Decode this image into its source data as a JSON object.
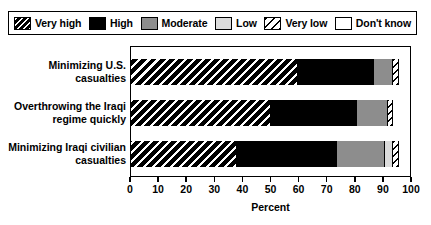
{
  "legend": {
    "items": [
      {
        "label": "Very high",
        "key": "veryhigh",
        "swatch": "black-diagonal-stripe-swatch",
        "color": "#000000"
      },
      {
        "label": "High",
        "key": "high",
        "swatch": "solid-black-swatch",
        "color": "#000000"
      },
      {
        "label": "Moderate",
        "key": "moderate",
        "swatch": "solid-gray-swatch",
        "color": "#8d8d8d"
      },
      {
        "label": "Low",
        "key": "low",
        "swatch": "solid-light-gray-swatch",
        "color": "#dcdcdc"
      },
      {
        "label": "Very low",
        "key": "verylow",
        "swatch": "white-diagonal-stripe-swatch",
        "color": "#ffffff"
      },
      {
        "label": "Don't know",
        "key": "dontknow",
        "swatch": "solid-white-swatch",
        "color": "#ffffff"
      }
    ]
  },
  "chart_data": {
    "type": "bar",
    "orientation": "horizontal",
    "stacked": true,
    "title": "",
    "xlabel": "Percent",
    "ylabel": "",
    "xlim": [
      0,
      100
    ],
    "xticks": [
      0,
      10,
      20,
      30,
      40,
      50,
      60,
      70,
      80,
      90,
      100
    ],
    "xticklabels": [
      "0",
      "10",
      "20",
      "30",
      "40",
      "50",
      "60",
      "70",
      "80",
      "90",
      "100"
    ],
    "grid": false,
    "legend_position": "top",
    "categories": [
      "Minimizing U.S. casualties",
      "Overthrowing the Iraqi regime quickly",
      "Minimizing Iraqi civilian casualties"
    ],
    "category_lines": [
      [
        "Minimizing U.S.",
        "casualties"
      ],
      [
        "Overthrowing the Iraqi",
        "regime quickly"
      ],
      [
        "Minimizing Iraqi civilian",
        "casualties"
      ]
    ],
    "series": [
      {
        "name": "Very high",
        "values": [
          60,
          50,
          38
        ]
      },
      {
        "name": "High",
        "values": [
          27,
          31,
          36
        ]
      },
      {
        "name": "Moderate",
        "values": [
          7,
          11,
          17
        ]
      },
      {
        "name": "Low",
        "values": [
          0,
          0,
          3
        ]
      },
      {
        "name": "Very low",
        "values": [
          2,
          2,
          2
        ]
      },
      {
        "name": "Don't know",
        "values": [
          4,
          6,
          4
        ]
      }
    ]
  }
}
